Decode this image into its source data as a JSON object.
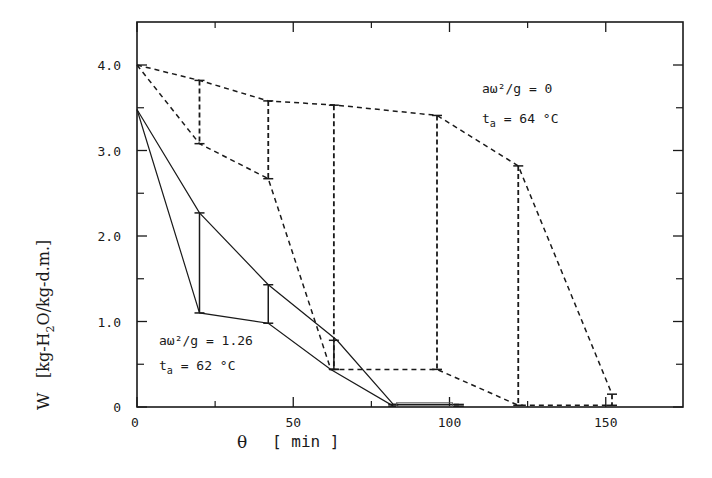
{
  "chart_data": {
    "type": "line",
    "title": "",
    "xlabel": "θ   [ min ]",
    "ylabel": "W   [kg-H2O/kg-d.m.]",
    "xlim": [
      0,
      165
    ],
    "ylim": [
      0,
      4.5
    ],
    "x_ticks": [
      0,
      50,
      100,
      150
    ],
    "x_tick_labels": [
      "0",
      "50",
      "100",
      "150"
    ],
    "x_minor_ticks": [
      25,
      75,
      125
    ],
    "y_ticks": [
      0,
      1.0,
      2.0,
      3.0,
      4.0
    ],
    "y_tick_labels": [
      "0",
      "1.0",
      "2.0",
      "3.0",
      "4.0"
    ],
    "y_minor_ticks": [
      0.5,
      1.5,
      2.5,
      3.5
    ],
    "grid": false,
    "series": [
      {
        "name": "aω²/g = 0, ta = 64 °C (upper bound)",
        "style": "dashed",
        "x": [
          0,
          20,
          42,
          64,
          96,
          122,
          152
        ],
        "values": [
          4.0,
          3.82,
          3.58,
          3.53,
          3.41,
          2.82,
          0.15
        ]
      },
      {
        "name": "aω²/g = 0, ta = 64 °C (lower bound)",
        "style": "dashed",
        "x": [
          0,
          20,
          42,
          62,
          96,
          122,
          152
        ],
        "values": [
          4.0,
          3.08,
          2.67,
          0.44,
          0.44,
          0.02,
          0.02
        ]
      },
      {
        "name": "aω²/g = 1.26, ta = 62 °C (upper bound)",
        "style": "solid",
        "x": [
          0,
          20,
          42,
          64,
          82,
          103
        ],
        "values": [
          3.48,
          2.27,
          1.43,
          0.78,
          0.03,
          0.03
        ]
      },
      {
        "name": "aω²/g = 1.26, ta = 62 °C (lower bound)",
        "style": "solid",
        "x": [
          0,
          20,
          42,
          62,
          82,
          103
        ],
        "values": [
          3.48,
          1.1,
          0.98,
          0.44,
          0.01,
          0.01
        ]
      }
    ],
    "annotations": [
      {
        "line1": "aω²/g = 0",
        "line2_main": "t",
        "line2_sub": "a",
        "line2_rest": " = 64 °C",
        "near_series": "dashed"
      },
      {
        "line1": "aω²/g = 1.26",
        "line2_main": "t",
        "line2_sub": "a",
        "line2_rest": " = 62 °C",
        "near_series": "solid"
      }
    ],
    "legend": "none (inline annotations)"
  },
  "labels": {
    "ylabel_main": "W",
    "ylabel_unit_pre": "[kg-H",
    "ylabel_unit_sub": "2",
    "ylabel_unit_post": "O/kg-d.m.]",
    "xlabel_symbol": "θ",
    "xlabel_unit": "[ min ]"
  },
  "colors": {
    "ink": "#1a1a1a",
    "background": "#ffffff"
  }
}
